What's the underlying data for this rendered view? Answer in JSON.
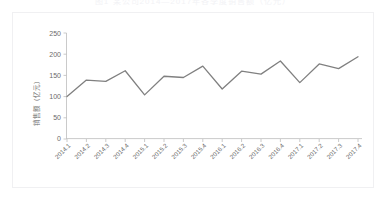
{
  "chart_data": {
    "type": "line",
    "title": "图1 某公司2014—2017年各季度销售额（亿元）",
    "xlabel": "",
    "ylabel": "销售额（亿元）",
    "categories": [
      "2014.1",
      "2014.2",
      "2014.3",
      "2014.4",
      "2015.1",
      "2015.2",
      "2015.3",
      "2015.4",
      "2016.1",
      "2016.2",
      "2016.3",
      "2016.4",
      "2017.1",
      "2017.2",
      "2017.3",
      "2017.4"
    ],
    "values": [
      100,
      139,
      136,
      161,
      104,
      148,
      145,
      172,
      118,
      160,
      153,
      184,
      133,
      177,
      166,
      194
    ],
    "series": [
      {
        "name": "销售额",
        "values": [
          100,
          139,
          136,
          161,
          104,
          148,
          145,
          172,
          118,
          160,
          153,
          184,
          133,
          177,
          166,
          194
        ]
      }
    ],
    "ylim": [
      0,
      250
    ],
    "yticks": [
      0,
      50,
      100,
      150,
      200,
      250
    ],
    "ytick_labels": [
      "0",
      "50",
      "100",
      "150",
      "200",
      "250"
    ],
    "grid": false,
    "legend": false,
    "legend_position": "none",
    "line_color": "#808080",
    "axis_color": "#bdbdbd",
    "background_color": "#ffffff",
    "xtick_rotation": -45
  },
  "axis": {
    "y_title": "销售额（亿元）"
  }
}
